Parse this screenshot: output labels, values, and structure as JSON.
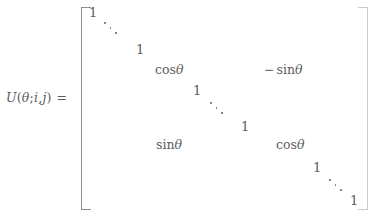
{
  "document": {
    "kind": "math-equation",
    "description": "Givens rotation matrix definition",
    "background_color": "#ffffff",
    "ink_color": "#5d5d5f",
    "bracket_color": "#8e8e92"
  },
  "equation": {
    "lhs": {
      "function_name": "U",
      "open_paren": "(",
      "theta": "θ",
      "separator_1": ";",
      "index_i": "i",
      "separator_2": ",",
      "index_j": "j",
      "close_paren": ")",
      "equals": "="
    },
    "matrix": {
      "open_bracket": "[",
      "close_bracket": "]",
      "entries": [
        {
          "id": "entry-1-top",
          "text": "1",
          "role": "identity-diagonal"
        },
        {
          "id": "ddots-upper",
          "text": "⋱",
          "role": "diagonal-ellipsis"
        },
        {
          "id": "entry-1-before-i",
          "text": "1",
          "role": "identity-diagonal"
        },
        {
          "id": "entry-cos-ii",
          "text": "cosθ",
          "role": "rotation-cos-ii"
        },
        {
          "id": "entry-minus-sin-ij",
          "text": "− sinθ",
          "role": "rotation-minus-sin-ij"
        },
        {
          "id": "entry-1-mid-upper",
          "text": "1",
          "role": "identity-diagonal"
        },
        {
          "id": "ddots-middle",
          "text": "⋱",
          "role": "diagonal-ellipsis"
        },
        {
          "id": "entry-1-mid-lower",
          "text": "1",
          "role": "identity-diagonal"
        },
        {
          "id": "entry-sin-ji",
          "text": "sinθ",
          "role": "rotation-sin-ji"
        },
        {
          "id": "entry-cos-jj",
          "text": "cosθ",
          "role": "rotation-cos-jj"
        },
        {
          "id": "entry-1-after-j",
          "text": "1",
          "role": "identity-diagonal"
        },
        {
          "id": "ddots-lower",
          "text": "⋱",
          "role": "diagonal-ellipsis"
        },
        {
          "id": "entry-1-bottom",
          "text": "1",
          "role": "identity-diagonal"
        }
      ],
      "cells": {
        "one_top": "1",
        "one_before_i": "1",
        "cos_ii": "cos",
        "minus_sign": "−",
        "sin_ij": "sin",
        "one_mid_upper": "1",
        "one_mid_lower": "1",
        "sin_ji": "sin",
        "cos_jj": "cos",
        "one_after_j": "1",
        "one_bottom": "1",
        "theta_glyph": "θ"
      }
    }
  },
  "edges": {
    "top_cut_text": "",
    "bottom_cut_text": ""
  }
}
